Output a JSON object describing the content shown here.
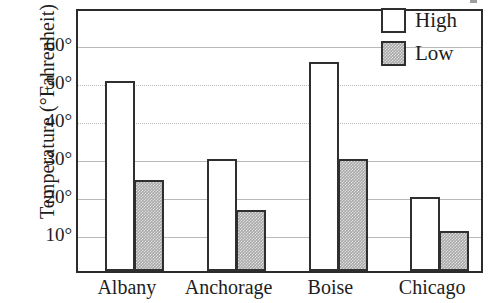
{
  "chart_data": {
    "type": "bar",
    "title": "",
    "xlabel": "",
    "ylabel": "Temperature (°Fahrenheit)",
    "categories": [
      "Albany",
      "Anchorage",
      "Boise",
      "Chicago"
    ],
    "series": [
      {
        "name": "High",
        "values": [
          50,
          29.5,
          55,
          19.5
        ],
        "fill": "#ffffff",
        "stroke": "#2f2f2f"
      },
      {
        "name": "Low",
        "values": [
          24,
          16,
          29.5,
          10.5
        ],
        "fill": "#a9a9a9",
        "stroke": "#2f2f2f"
      }
    ],
    "ylim": [
      0,
      69.5
    ],
    "yticks": [
      10,
      20,
      30,
      40,
      50,
      60
    ],
    "ytick_labels": [
      "10°",
      "20°",
      "30°",
      "40°",
      "50°",
      "60°"
    ],
    "grid": true,
    "legend_position": "top-right",
    "legend_entries": [
      "High",
      "Low"
    ]
  },
  "axis": {
    "y_title": "Temperature (°Fahrenheit)",
    "ticks": [
      {
        "label": "60°",
        "value": 60
      },
      {
        "label": "50°",
        "value": 50
      },
      {
        "label": "40°",
        "value": 40
      },
      {
        "label": "30°",
        "value": 30
      },
      {
        "label": "20°",
        "value": 20
      },
      {
        "label": "10°",
        "value": 10
      }
    ]
  },
  "categories": [
    {
      "label": "Albany"
    },
    {
      "label": "Anchorage"
    },
    {
      "label": "Boise"
    },
    {
      "label": "Chicago"
    }
  ],
  "legend": {
    "items": [
      {
        "label": "High",
        "swatch": "swatch-unfilled"
      },
      {
        "label": "Low",
        "swatch": "swatch-grey-hatched"
      }
    ]
  }
}
